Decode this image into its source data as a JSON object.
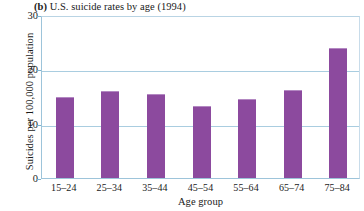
{
  "chart_data": {
    "type": "bar",
    "title": "(b) U.S. suicide rates by age (1994)",
    "panel_letter": "(b)",
    "title_rest": " U.S. suicide rates by age (1994)",
    "xlabel": "Age group",
    "ylabel": "Suicides per 100,000 population",
    "categories": [
      "15–24",
      "25–34",
      "35–44",
      "45–54",
      "55–64",
      "65–74",
      "75–84"
    ],
    "values": [
      14.8,
      15.9,
      15.3,
      13.0,
      14.3,
      16.0,
      23.8
    ],
    "ylim": [
      0,
      30
    ],
    "yticks": [
      "0",
      "10",
      "20",
      "30"
    ],
    "ytick_values": [
      0,
      10,
      20,
      30
    ],
    "grid": true,
    "legend": "none",
    "bar_color": "#8c4a9e",
    "grid_color": "#a9cde0",
    "axis_color": "#9dc4da",
    "background": "#ffffff"
  }
}
